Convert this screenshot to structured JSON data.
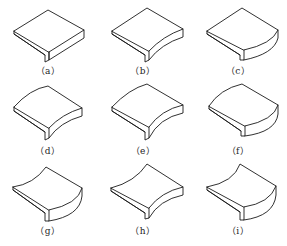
{
  "figure": {
    "panels": [
      {
        "id": "a",
        "label": "（a）",
        "front_edge": "straight",
        "side_edge": "straight",
        "back_edge": "straight"
      },
      {
        "id": "b",
        "label": "（b）",
        "front_edge": "concave",
        "side_edge": "straight",
        "back_edge": "straight"
      },
      {
        "id": "c",
        "label": "（c）",
        "front_edge": "convex",
        "side_edge": "straight",
        "back_edge": "straight"
      },
      {
        "id": "d",
        "label": "（d）",
        "front_edge": "concave",
        "side_edge": "straight",
        "back_edge": "convex"
      },
      {
        "id": "e",
        "label": "（e）",
        "front_edge": "concave",
        "side_edge": "straight",
        "back_edge": "convex"
      },
      {
        "id": "f",
        "label": "（f）",
        "front_edge": "convex",
        "side_edge": "straight",
        "back_edge": "convex"
      },
      {
        "id": "g",
        "label": "（g）",
        "front_edge": "convex",
        "side_edge": "straight",
        "back_edge": "concave"
      },
      {
        "id": "h",
        "label": "（h）",
        "front_edge": "concave",
        "side_edge": "straight",
        "back_edge": "concave"
      },
      {
        "id": "i",
        "label": "（i）",
        "front_edge": "convex",
        "side_edge": "straight",
        "back_edge": "concave"
      }
    ]
  },
  "colors": {
    "line": "#1a1a1a",
    "background": "#ffffff"
  }
}
